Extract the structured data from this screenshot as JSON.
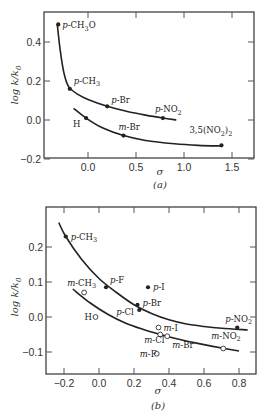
{
  "chart_data": [
    {
      "type": "scatter",
      "panel": "(a)",
      "xlabel": "σ",
      "ylabel": "log k/k0",
      "xlim": [
        -0.4,
        1.75
      ],
      "ylim": [
        -0.2,
        0.52
      ],
      "xticks": [
        0.0,
        0.5,
        1.0,
        1.5
      ],
      "xtick_labels": [
        "0.0",
        "0.5",
        "1.0",
        "1.5"
      ],
      "yticks": [
        -0.2,
        0.0,
        0.2,
        0.4
      ],
      "ytick_labels": [
        "−0.2",
        "0.0",
        "0.2",
        "0.4"
      ],
      "grid": false,
      "series": [
        {
          "name": "para substituents (upper curve)",
          "marker": "filled",
          "points": [
            {
              "label": "p-CH3O",
              "x": -0.31,
              "y": 0.49
            },
            {
              "label": "p-CH3",
              "x": -0.19,
              "y": 0.16
            },
            {
              "label": "p-Br",
              "x": 0.2,
              "y": 0.07
            },
            {
              "label": "p-NO2",
              "x": 0.78,
              "y": 0.01
            }
          ],
          "curve": [
            [
              -0.32,
              0.49
            ],
            [
              -0.29,
              0.36
            ],
            [
              -0.25,
              0.24
            ],
            [
              -0.2,
              0.17
            ],
            [
              -0.1,
              0.13
            ],
            [
              0.0,
              0.105
            ],
            [
              0.2,
              0.07
            ],
            [
              0.4,
              0.045
            ],
            [
              0.6,
              0.025
            ],
            [
              0.78,
              0.01
            ],
            [
              0.92,
              0.0
            ]
          ]
        },
        {
          "name": "meta / H (lower curve)",
          "marker": "filled",
          "points": [
            {
              "label": "H",
              "x": -0.02,
              "y": 0.01
            },
            {
              "label": "m-Br",
              "x": 0.37,
              "y": -0.08
            },
            {
              "label": "3,5(NO2)2",
              "x": 1.39,
              "y": -0.13
            }
          ],
          "curve": [
            [
              -0.15,
              0.06
            ],
            [
              -0.02,
              0.01
            ],
            [
              0.15,
              -0.04
            ],
            [
              0.37,
              -0.08
            ],
            [
              0.6,
              -0.105
            ],
            [
              0.9,
              -0.122
            ],
            [
              1.15,
              -0.13
            ],
            [
              1.39,
              -0.133
            ]
          ]
        }
      ]
    },
    {
      "type": "scatter",
      "panel": "(b)",
      "xlabel": "σ",
      "ylabel": "log k/k0",
      "xlim": [
        -0.27,
        0.87
      ],
      "ylim": [
        -0.155,
        0.28
      ],
      "xticks": [
        -0.2,
        0.0,
        0.2,
        0.4,
        0.6,
        0.8
      ],
      "xtick_labels": [
        "−0.2",
        "0.0",
        "0.2",
        "0.4",
        "0.6",
        "0.8"
      ],
      "yticks": [
        -0.1,
        0.0,
        0.1,
        0.2
      ],
      "ytick_labels": [
        "−0.1",
        "0.0",
        "0.1",
        "0.2"
      ],
      "grid": false,
      "series": [
        {
          "name": "para substituents (filled)",
          "marker": "filled",
          "points": [
            {
              "label": "p-CH3",
              "x": -0.19,
              "y": 0.23
            },
            {
              "label": "p-F",
              "x": 0.04,
              "y": 0.085
            },
            {
              "label": "p-I",
              "x": 0.28,
              "y": 0.085
            },
            {
              "label": "p-Br",
              "x": 0.22,
              "y": 0.035
            },
            {
              "label": "p-Cl",
              "x": 0.23,
              "y": 0.02
            },
            {
              "label": "p-NO2",
              "x": 0.79,
              "y": -0.03
            }
          ],
          "curve": [
            [
              -0.23,
              0.27
            ],
            [
              -0.19,
              0.23
            ],
            [
              -0.1,
              0.165
            ],
            [
              0.0,
              0.11
            ],
            [
              0.1,
              0.07
            ],
            [
              0.2,
              0.035
            ],
            [
              0.3,
              0.01
            ],
            [
              0.4,
              -0.008
            ],
            [
              0.5,
              -0.02
            ],
            [
              0.6,
              -0.027
            ],
            [
              0.7,
              -0.032
            ],
            [
              0.85,
              -0.037
            ]
          ]
        },
        {
          "name": "meta substituents / H (open)",
          "marker": "open",
          "points": [
            {
              "label": "m-CH3",
              "x": -0.085,
              "y": 0.07
            },
            {
              "label": "H",
              "x": -0.02,
              "y": 0.0
            },
            {
              "label": "m-I",
              "x": 0.34,
              "y": -0.03
            },
            {
              "label": "m-Cl",
              "x": 0.35,
              "y": -0.05
            },
            {
              "label": "m-Br",
              "x": 0.39,
              "y": -0.055
            },
            {
              "label": "m-F",
              "x": 0.33,
              "y": -0.105
            },
            {
              "label": "m-NO2",
              "x": 0.71,
              "y": -0.09
            }
          ],
          "curve": [
            [
              -0.15,
              0.08
            ],
            [
              -0.05,
              0.04
            ],
            [
              0.05,
              0.008
            ],
            [
              0.15,
              -0.017
            ],
            [
              0.25,
              -0.035
            ],
            [
              0.35,
              -0.05
            ],
            [
              0.45,
              -0.063
            ],
            [
              0.55,
              -0.074
            ],
            [
              0.65,
              -0.084
            ],
            [
              0.8,
              -0.097
            ]
          ]
        }
      ]
    }
  ]
}
